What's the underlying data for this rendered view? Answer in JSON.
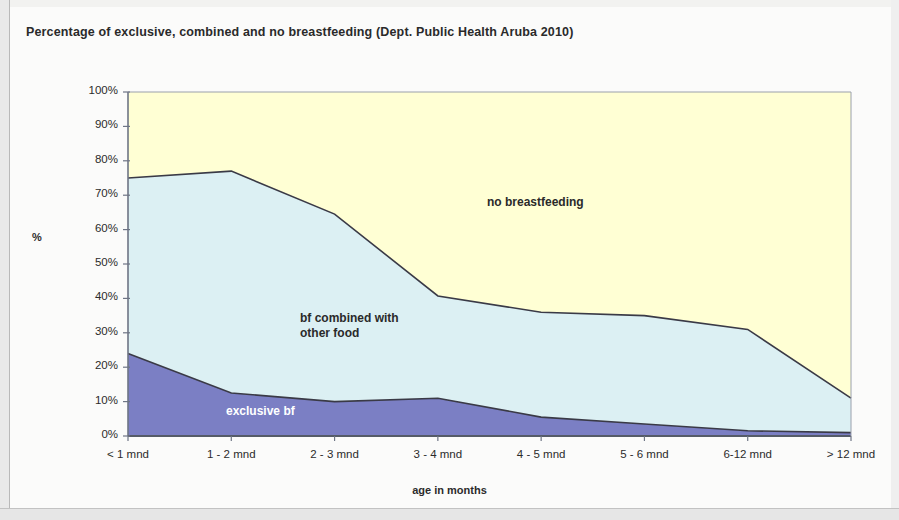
{
  "chart_data": {
    "type": "area",
    "title": "Percentage of exclusive, combined and no breastfeeding (Dept. Public Health Aruba 2010)",
    "xlabel": "age in months",
    "ylabel": "%",
    "stacked": true,
    "categories": [
      "< 1 mnd",
      "1 - 2 mnd",
      "2 - 3 mnd",
      "3 - 4 mnd",
      "4 - 5 mnd",
      "5 - 6 mnd",
      "6-12 mnd",
      "> 12 mnd"
    ],
    "series": [
      {
        "name": "exclusive bf",
        "color": "#7B7FC4",
        "values": [
          24,
          12.5,
          10,
          11,
          5.5,
          3.5,
          1.5,
          1
        ]
      },
      {
        "name": "bf combined with other food",
        "color": "#DCF0F3",
        "values": [
          51,
          64.5,
          54.5,
          29.7,
          30.5,
          31.5,
          29.5,
          10
        ]
      },
      {
        "name": "no breastfeeding",
        "color": "#FFFFD4",
        "values": [
          25,
          23,
          35.5,
          59.3,
          64,
          65,
          69,
          89
        ]
      }
    ],
    "cumulative_top_boundary": [
      75,
      77,
      64.5,
      40.7,
      36,
      35,
      31,
      11
    ],
    "ylim": [
      0,
      100
    ],
    "ytick_labels": [
      "0%",
      "10%",
      "20%",
      "30%",
      "40%",
      "50%",
      "60%",
      "70%",
      "80%",
      "90%",
      "100%"
    ],
    "ytick_values": [
      0,
      10,
      20,
      30,
      40,
      50,
      60,
      70,
      80,
      90,
      100
    ],
    "grid": false,
    "legend_position": "inline-annotations",
    "annotations": [
      {
        "text": "no breastfeeding",
        "series": "no breastfeeding"
      },
      {
        "text": "bf combined with\nother food",
        "series": "bf combined with other food"
      },
      {
        "text": "exclusive bf",
        "series": "exclusive bf"
      }
    ]
  }
}
